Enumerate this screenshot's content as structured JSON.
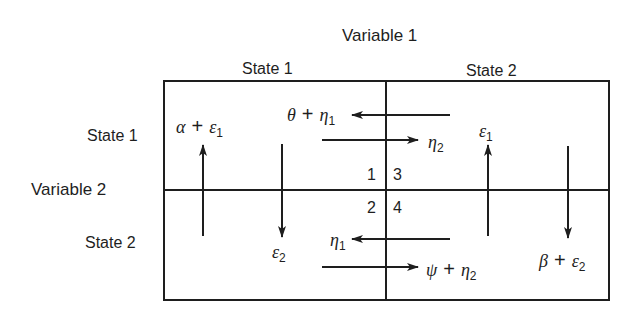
{
  "title": "Variable 1",
  "columns": [
    {
      "label": "State 1"
    },
    {
      "label": "State 2"
    }
  ],
  "row_axis_title": "Variable 2",
  "rows": [
    {
      "label": "State 1"
    },
    {
      "label": "State 2"
    }
  ],
  "cell_numbers": [
    "1",
    "2",
    "3",
    "4"
  ],
  "payoffs": {
    "alpha": {
      "sym": "α",
      "op": "+",
      "noise": "ε",
      "sub": "1"
    },
    "theta": {
      "sym": "θ",
      "op": "+",
      "noise": "η",
      "sub": "1"
    },
    "eta2_top": {
      "sym": "η",
      "sub": "2"
    },
    "eps1_right": {
      "sym": "ε",
      "sub": "1"
    },
    "eps2_left": {
      "sym": "ε",
      "sub": "2"
    },
    "eta1_bottom": {
      "sym": "η",
      "sub": "1"
    },
    "psi": {
      "sym": "ψ",
      "op": "+",
      "noise": "η",
      "sub": "2"
    },
    "beta": {
      "sym": "β",
      "op": "+",
      "noise": "ε",
      "sub": "2"
    }
  },
  "colors": {
    "ink": "#1e1e1e",
    "background": "#ffffff"
  }
}
